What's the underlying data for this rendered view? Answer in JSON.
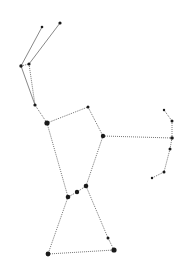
{
  "diagram": {
    "background": "#ffffff",
    "line_color": "#555555",
    "star_color": "#1a1a1a",
    "stars": [
      {
        "id": "club-a",
        "x": 42,
        "y": 27,
        "r": 1.3
      },
      {
        "id": "club-b",
        "x": 60,
        "y": 23,
        "r": 1.6
      },
      {
        "id": "arm-a",
        "x": 21,
        "y": 66,
        "r": 1.7
      },
      {
        "id": "arm-b",
        "x": 29,
        "y": 64,
        "r": 1.6
      },
      {
        "id": "arm-c",
        "x": 35,
        "y": 105,
        "r": 1.6
      },
      {
        "id": "betelgeuse",
        "x": 47,
        "y": 123,
        "r": 2.6
      },
      {
        "id": "meissa",
        "x": 88,
        "y": 107,
        "r": 1.5
      },
      {
        "id": "bellatrix",
        "x": 103,
        "y": 136,
        "r": 2.2
      },
      {
        "id": "shield-1",
        "x": 164,
        "y": 110,
        "r": 1.2
      },
      {
        "id": "shield-2",
        "x": 172,
        "y": 121,
        "r": 1.5
      },
      {
        "id": "shield-3",
        "x": 172,
        "y": 138,
        "r": 1.8
      },
      {
        "id": "shield-4",
        "x": 170,
        "y": 149,
        "r": 1.5
      },
      {
        "id": "shield-5",
        "x": 164,
        "y": 172,
        "r": 1.5
      },
      {
        "id": "shield-6",
        "x": 152,
        "y": 178,
        "r": 1.2
      },
      {
        "id": "alnitak",
        "x": 68,
        "y": 197,
        "r": 2.3
      },
      {
        "id": "alnilam",
        "x": 77,
        "y": 192,
        "r": 2.2
      },
      {
        "id": "mintaka",
        "x": 86,
        "y": 186,
        "r": 2.3
      },
      {
        "id": "sword",
        "x": 108,
        "y": 238,
        "r": 1.5
      },
      {
        "id": "saiph",
        "x": 48,
        "y": 254,
        "r": 2.4
      },
      {
        "id": "rigel",
        "x": 114,
        "y": 250,
        "r": 2.6
      }
    ],
    "lines": [
      {
        "from": "club-a",
        "to": "arm-a",
        "style": "solid"
      },
      {
        "from": "club-b",
        "to": "arm-b",
        "style": "solid"
      },
      {
        "from": "arm-a",
        "to": "arm-b",
        "style": "dotted"
      },
      {
        "from": "arm-a",
        "to": "arm-c",
        "style": "solid"
      },
      {
        "from": "arm-b",
        "to": "arm-c",
        "style": "dotted"
      },
      {
        "from": "arm-c",
        "to": "betelgeuse",
        "style": "dotted"
      },
      {
        "from": "betelgeuse",
        "to": "meissa",
        "style": "dotted"
      },
      {
        "from": "meissa",
        "to": "bellatrix",
        "style": "dotted"
      },
      {
        "from": "bellatrix",
        "to": "shield-3",
        "style": "dotted"
      },
      {
        "from": "shield-1",
        "to": "shield-2",
        "style": "dotted"
      },
      {
        "from": "shield-2",
        "to": "shield-3",
        "style": "dotted"
      },
      {
        "from": "shield-3",
        "to": "shield-4",
        "style": "dotted"
      },
      {
        "from": "shield-4",
        "to": "shield-5",
        "style": "dotted"
      },
      {
        "from": "shield-5",
        "to": "shield-6",
        "style": "dotted"
      },
      {
        "from": "betelgeuse",
        "to": "alnitak",
        "style": "dotted"
      },
      {
        "from": "bellatrix",
        "to": "mintaka",
        "style": "dotted"
      },
      {
        "from": "alnitak",
        "to": "alnilam",
        "style": "dotted"
      },
      {
        "from": "alnilam",
        "to": "mintaka",
        "style": "dotted"
      },
      {
        "from": "alnitak",
        "to": "saiph",
        "style": "dotted"
      },
      {
        "from": "mintaka",
        "to": "sword",
        "style": "dotted"
      },
      {
        "from": "sword",
        "to": "rigel",
        "style": "dotted"
      },
      {
        "from": "saiph",
        "to": "rigel",
        "style": "dotted"
      }
    ]
  }
}
